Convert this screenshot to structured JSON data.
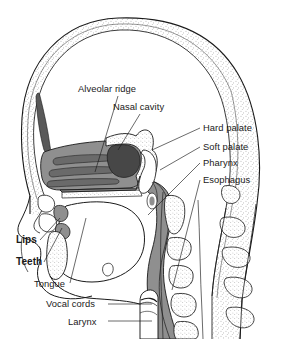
{
  "figure": {
    "type": "anatomical-diagram",
    "background_color": "#ffffff",
    "line_color": "#1a1a1a",
    "palette": {
      "soft_tissue_gray": "#8c8c8c",
      "dark_cavity": "#4a4a4a",
      "bone_white": "#ffffff",
      "stipple": "#555555",
      "turbinate_gray": "#6f6f6f"
    }
  },
  "labels": [
    {
      "id": "alveolar-ridge",
      "text": "Alveolar ridge",
      "x": 78,
      "y": 92,
      "anchor": "start",
      "leader": [
        [
          118,
          96
        ],
        [
          95,
          172
        ]
      ]
    },
    {
      "id": "nasal-cavity",
      "text": "Nasal cavity",
      "x": 113,
      "y": 110,
      "anchor": "start",
      "leader": [
        [
          140,
          114
        ],
        [
          118,
          150
        ]
      ]
    },
    {
      "id": "hard-palate",
      "text": "Hard palate",
      "x": 203,
      "y": 131,
      "anchor": "start",
      "leader": [
        [
          200,
          128
        ],
        [
          152,
          150
        ]
      ]
    },
    {
      "id": "soft-palate",
      "text": "Soft palate",
      "x": 203,
      "y": 150,
      "anchor": "start",
      "leader": [
        [
          200,
          147
        ],
        [
          160,
          170
        ]
      ]
    },
    {
      "id": "pharynx",
      "text": "Pharynx",
      "x": 203,
      "y": 166,
      "anchor": "start",
      "leader": [
        [
          200,
          163
        ],
        [
          148,
          215
        ]
      ]
    },
    {
      "id": "esophagus",
      "text": "Esophagus",
      "x": 203,
      "y": 183,
      "anchor": "start",
      "leader": [
        [
          200,
          180
        ],
        [
          172,
          290
        ]
      ]
    },
    {
      "id": "lips",
      "text": "Lips",
      "x": 16,
      "y": 243,
      "anchor": "start",
      "leader": [
        [
          40,
          240
        ],
        [
          60,
          218
        ]
      ]
    },
    {
      "id": "teeth",
      "text": "Teeth",
      "x": 16,
      "y": 265,
      "anchor": "start",
      "leader": [
        [
          44,
          262
        ],
        [
          62,
          228
        ]
      ]
    },
    {
      "id": "tongue",
      "text": "Tongue",
      "x": 34,
      "y": 287,
      "anchor": "start",
      "leader": [
        [
          70,
          283
        ],
        [
          86,
          218
        ]
      ]
    },
    {
      "id": "vocal-cords",
      "text": "Vocal cords",
      "x": 46,
      "y": 307,
      "anchor": "start",
      "leader": [
        [
          108,
          304
        ],
        [
          152,
          304
        ]
      ]
    },
    {
      "id": "larynx",
      "text": "Larynx",
      "x": 68,
      "y": 325,
      "anchor": "start",
      "leader": [
        [
          108,
          321
        ],
        [
          152,
          321
        ]
      ]
    }
  ],
  "structures": [
    {
      "id": "cranium",
      "name": "Cranium (skull vault)",
      "fill": "bone-white-stippled"
    },
    {
      "id": "frontal-sinus",
      "name": "Frontal sinus",
      "fill": "dark-gray"
    },
    {
      "id": "nasal-cavity-space",
      "name": "Nasal cavity",
      "fill": "soft-tissue-gray"
    },
    {
      "id": "turbinates",
      "name": "Nasal turbinates",
      "count": 3,
      "fill": "darker-gray"
    },
    {
      "id": "nasopharynx",
      "name": "Nasopharynx",
      "fill": "dark-gray"
    },
    {
      "id": "hard-palate-bone",
      "name": "Hard palate",
      "fill": "bone-white-stippled"
    },
    {
      "id": "soft-palate-body",
      "name": "Soft palate / velum",
      "fill": "white"
    },
    {
      "id": "tongue-body",
      "name": "Tongue",
      "fill": "white"
    },
    {
      "id": "mandible",
      "name": "Mandible",
      "fill": "bone-white-stippled"
    },
    {
      "id": "pharyngeal-wall",
      "name": "Pharyngeal wall",
      "fill": "soft-tissue-gray"
    },
    {
      "id": "larynx-body",
      "name": "Larynx / trachea",
      "fill": "white"
    },
    {
      "id": "vertebrae",
      "name": "Cervical vertebrae",
      "count": 5,
      "fill": "bone-white-stippled"
    },
    {
      "id": "spinous-processes",
      "name": "Spinous processes",
      "count": 5,
      "fill": "bone-white-stippled"
    }
  ]
}
